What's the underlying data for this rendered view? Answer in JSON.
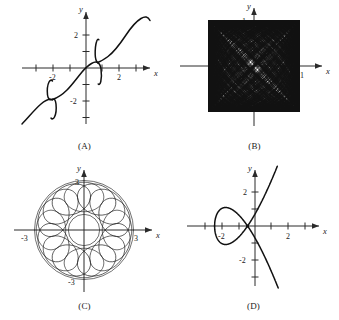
{
  "figure": {
    "background": "#ffffff",
    "ink": "#111111",
    "width": 339,
    "height": 320
  },
  "panels": [
    {
      "id": "A",
      "caption": "(A)",
      "axis_labels": {
        "x": "x",
        "y": "y"
      },
      "tick_labels": {
        "x": [
          "-2",
          "2"
        ],
        "y": [
          "2",
          "-2"
        ]
      },
      "xlim": [
        -3.4,
        3.2
      ],
      "ylim": [
        -3.6,
        3.4
      ],
      "xticks": [
        -3,
        -2,
        -1,
        1,
        2,
        3
      ],
      "yticks": [
        -3,
        -2,
        -1,
        1,
        2,
        3
      ],
      "chart_data": {
        "type": "line",
        "title": "",
        "xlabel": "x",
        "ylabel": "y",
        "description": "Increasing S-shaped curve with two vertical-tangent wiggles, symmetric about the origin",
        "xlim": [
          -3.4,
          3.2
        ],
        "ylim": [
          -3.6,
          3.4
        ],
        "grid": false,
        "series": [
          {
            "name": "main-curve",
            "x": [
              -3.4,
              -3.1,
              -2.8,
              -2.55,
              -2.35,
              -2.2,
              -2.1,
              -2.0,
              -1.9,
              -1.8,
              -1.6,
              -1.2,
              -0.8,
              -0.4,
              0.0,
              0.3,
              0.5,
              0.62,
              0.72,
              0.8,
              0.88,
              1.0,
              1.15,
              1.35,
              1.6,
              1.9,
              2.2,
              2.5,
              2.8,
              3.05,
              3.2
            ],
            "y": [
              -3.3,
              -2.95,
              -2.75,
              -2.7,
              -2.78,
              -3.0,
              -3.3,
              -2.05,
              -1.75,
              -1.9,
              -2.1,
              -1.95,
              -1.5,
              -0.85,
              -0.2,
              0.25,
              0.4,
              0.3,
              -0.15,
              -1.0,
              1.95,
              1.45,
              1.25,
              1.3,
              1.55,
              2.0,
              2.5,
              2.95,
              3.2,
              3.25,
              3.1
            ]
          }
        ]
      }
    },
    {
      "id": "B",
      "caption": "(B)",
      "axis_labels": {
        "x": "x",
        "y": "y"
      },
      "tick_labels": {
        "x": [
          "1"
        ],
        "y": [
          "1"
        ]
      },
      "xlim": [
        -1.55,
        1.55
      ],
      "ylim": [
        -1.6,
        1.5
      ],
      "chart_data": {
        "type": "line",
        "title": "",
        "xlabel": "x",
        "ylabel": "y",
        "description": "Dense Lissajous-type weave filling a square of side 2 centered on the origin, with bright X-shaped voids along the diagonals",
        "xlim": [
          -1.55,
          1.55
        ],
        "ylim": [
          -1.6,
          1.5
        ],
        "grid": false,
        "parametric": {
          "x": "sin(a*t)",
          "y": "sin(b*t)",
          "harmonics": [
            [
              1,
              1
            ],
            [
              3,
              1
            ],
            [
              1,
              3
            ],
            [
              5,
              3
            ],
            [
              3,
              5
            ],
            [
              5,
              7
            ],
            [
              7,
              5
            ],
            [
              9,
              7
            ],
            [
              7,
              9
            ],
            [
              11,
              9
            ],
            [
              9,
              11
            ],
            [
              13,
              11
            ],
            [
              11,
              13
            ],
            [
              15,
              13
            ],
            [
              13,
              15
            ],
            [
              17,
              15
            ],
            [
              15,
              17
            ],
            [
              19,
              17
            ],
            [
              17,
              19
            ],
            [
              21,
              19
            ],
            [
              19,
              21
            ],
            [
              23,
              21
            ],
            [
              21,
              23
            ],
            [
              25,
              23
            ],
            [
              23,
              25
            ]
          ],
          "square_half_side": 1.0
        }
      }
    },
    {
      "id": "C",
      "caption": "(C)",
      "axis_labels": {
        "x": "x",
        "y": "y"
      },
      "tick_labels": {
        "x": [
          "-3",
          "3"
        ],
        "y": [
          "3",
          "-3"
        ]
      },
      "xlim": [
        -4.0,
        4.0
      ],
      "ylim": [
        -4.0,
        4.0
      ],
      "chart_data": {
        "type": "line",
        "title": "",
        "xlabel": "x",
        "ylabel": "y",
        "description": "Spirograph rosette: sixteen overlapping petal loops forming a ring with an empty circular hole at the centre; outer radius about 3",
        "xlim": [
          -4.0,
          4.0
        ],
        "ylim": [
          -4.0,
          4.0
        ],
        "grid": false,
        "parametric": {
          "type": "epitrochoid",
          "R": 1.85,
          "r": 1.15,
          "lobes": 16,
          "outer_radius": 3.0,
          "inner_hole_radius": 0.95
        }
      }
    },
    {
      "id": "D",
      "caption": "(D)",
      "axis_labels": {
        "x": "x",
        "y": "y"
      },
      "tick_labels": {
        "x": [
          "-2",
          "2"
        ],
        "y": [
          "2",
          "-2"
        ]
      },
      "xlim": [
        -3.4,
        3.4
      ],
      "ylim": [
        -3.8,
        3.6
      ],
      "xticks": [
        -3,
        -2,
        -1,
        1,
        2,
        3
      ],
      "yticks": [
        -3,
        -2,
        -1,
        1,
        2,
        3
      ],
      "chart_data": {
        "type": "line",
        "title": "",
        "xlabel": "x",
        "ylabel": "y",
        "description": "Elliptic alpha-curve with a closed loop from x=-2 to a node near x=-0.45 and two branches rising and falling steeply",
        "xlim": [
          -3.4,
          3.4
        ],
        "ylim": [
          -3.8,
          3.6
        ],
        "grid": false,
        "implicit": "y^2 = x^2*(x+2)",
        "node": [
          -0.45,
          0.0
        ],
        "loop_left_end": [
          -2.0,
          0.0
        ]
      }
    }
  ]
}
